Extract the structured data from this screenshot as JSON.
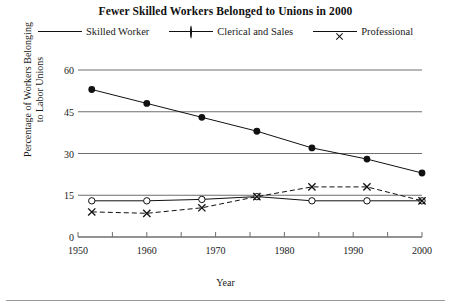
{
  "chart_data": {
    "type": "line",
    "title": "Fewer Skilled Workers Belonged to Unions in 2000",
    "xlabel": "Year",
    "ylabel_line1": "Percentage of Workers Belonging",
    "ylabel_line2": "to Labor Unions",
    "xlim": [
      1950,
      2000
    ],
    "ylim": [
      0,
      60
    ],
    "yticks": [
      60,
      45,
      30,
      15,
      0
    ],
    "xticks_labeled": [
      1950,
      1960,
      1970,
      1980,
      1990,
      2000
    ],
    "xticks_minor": [
      1955,
      1965,
      1975,
      1985,
      1995
    ],
    "grid": "horizontal",
    "legend_position": "top-center",
    "x": [
      1952,
      1960,
      1968,
      1976,
      1984,
      1992,
      2000
    ],
    "series": [
      {
        "name": "Skilled Worker",
        "marker": "filled-circle",
        "line_style": "solid",
        "values": [
          53,
          48,
          43,
          38,
          32,
          28,
          23
        ]
      },
      {
        "name": "Clerical and Sales",
        "marker": "open-circle",
        "line_style": "solid",
        "values": [
          13,
          13,
          13.5,
          14.5,
          13,
          13,
          13
        ]
      },
      {
        "name": "Professional",
        "marker": "x",
        "line_style": "dashed",
        "values": [
          9,
          8.5,
          10.5,
          14.5,
          18,
          18,
          13
        ]
      }
    ]
  },
  "colors": {
    "ink": "#111111",
    "gridline": "#6f6f6f",
    "axis": "#6f6f6f",
    "background": "#ffffff"
  }
}
